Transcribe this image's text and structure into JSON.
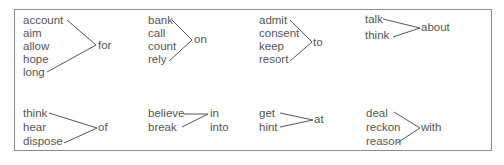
{
  "groups": [
    {
      "verbs": [
        "account",
        "aim",
        "allow",
        "hope",
        "long"
      ],
      "preps": [
        "for"
      ]
    },
    {
      "verbs": [
        "bank",
        "call",
        "count",
        "rely"
      ],
      "preps": [
        "on"
      ]
    },
    {
      "verbs": [
        "admit",
        "consent",
        "keep",
        "resort"
      ],
      "preps": [
        "to"
      ]
    },
    {
      "verbs": [
        "talk",
        "think"
      ],
      "preps": [
        "about"
      ]
    },
    {
      "verbs": [
        "think",
        "hear",
        "dispose"
      ],
      "preps": [
        "of"
      ]
    },
    {
      "verbs": [
        "believe",
        "break"
      ],
      "preps": [
        "in",
        "into"
      ]
    },
    {
      "verbs": [
        "get",
        "hint"
      ],
      "preps": [
        "at"
      ]
    },
    {
      "verbs": [
        "deal",
        "reckon",
        "reason"
      ],
      "preps": [
        "with"
      ]
    }
  ],
  "colors": {
    "text": "#555555",
    "border": "#8a8a8a"
  }
}
